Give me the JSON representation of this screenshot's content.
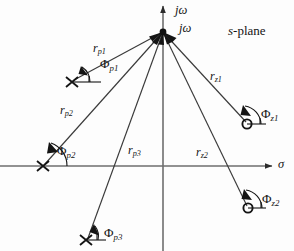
{
  "figure": {
    "plane_label": {
      "italic": "s",
      "rest": "-plane"
    },
    "background_color": "#fdfdfd",
    "ink_color": "#141414",
    "axis_color": "#6e6e6e"
  },
  "axes": {
    "vertical": {
      "name": "imaginary-axis",
      "label_main": "jω",
      "label_at_point": "jω",
      "x": 163,
      "y_top": 4,
      "y_bottom": 251
    },
    "horizontal": {
      "name": "real-axis",
      "label": "σ",
      "y": 166,
      "x_left": 0,
      "x_right": 276
    }
  },
  "evaluation_point": {
    "name": "evaluation-point",
    "x": 163,
    "y": 32,
    "marker": "filled-dot"
  },
  "poles": [
    {
      "id": "p1",
      "marker": "x",
      "x": 72,
      "y": 82,
      "r_label": {
        "base": "r",
        "sub": "p1"
      },
      "phi_label": {
        "base": "Φ",
        "sub": "p1"
      },
      "r_label_pos": {
        "x": 93,
        "y": 45
      },
      "phi_label_pos": {
        "x": 100,
        "y": 60
      },
      "arrowhead": {
        "x": 88,
        "y": 74
      },
      "tick_end": {
        "x": 101,
        "y": 82
      },
      "arc_radius": 17
    },
    {
      "id": "p2",
      "marker": "x",
      "x": 43,
      "y": 166,
      "r_label": {
        "base": "r",
        "sub": "p2"
      },
      "phi_label": {
        "base": "Φ",
        "sub": "p2"
      },
      "r_label_pos": {
        "x": 60,
        "y": 108
      },
      "phi_label_pos": {
        "x": 57,
        "y": 148
      },
      "arrowhead": {
        "x": 49,
        "y": 157
      },
      "tick_end": {
        "x": 43,
        "y": 166
      },
      "arc_radius": 23
    },
    {
      "id": "p3",
      "marker": "x",
      "x": 86,
      "y": 240,
      "r_label": {
        "base": "r",
        "sub": "p3"
      },
      "phi_label": {
        "base": "Φ",
        "sub": "p3"
      },
      "r_label_pos": {
        "x": 128,
        "y": 148
      },
      "phi_label_pos": {
        "x": 106,
        "y": 231
      },
      "arrowhead": {
        "x": 96,
        "y": 231
      },
      "tick_end": {
        "x": 104,
        "y": 240
      },
      "arc_radius": 17
    }
  ],
  "zeros": [
    {
      "id": "z1",
      "marker": "o",
      "x": 248,
      "y": 124,
      "r_label": {
        "base": "r",
        "sub": "z1"
      },
      "phi_label": {
        "base": "Φ",
        "sub": "z1"
      },
      "r_label_pos": {
        "x": 211,
        "y": 74
      },
      "phi_label_pos": {
        "x": 263,
        "y": 111
      },
      "arrowhead": {
        "x": 240,
        "y": 114
      },
      "tick_end": {
        "x": 266,
        "y": 124
      },
      "arc_radius": 18
    },
    {
      "id": "z2",
      "marker": "o",
      "x": 249,
      "y": 208,
      "r_label": {
        "base": "r",
        "sub": "z2"
      },
      "phi_label": {
        "base": "Φ",
        "sub": "z2"
      },
      "r_label_pos": {
        "x": 196,
        "y": 150
      },
      "phi_label_pos": {
        "x": 263,
        "y": 196
      },
      "arrowhead": {
        "x": 241,
        "y": 199
      },
      "tick_end": {
        "x": 266,
        "y": 208
      },
      "arc_radius": 18
    }
  ]
}
